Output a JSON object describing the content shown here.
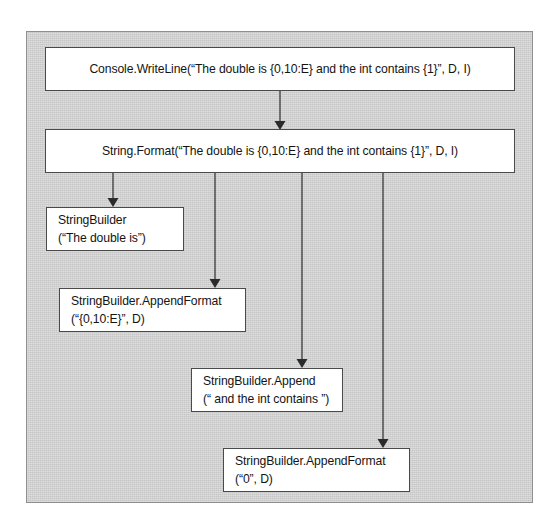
{
  "diagram": {
    "frame": {
      "background_color": "#d2d2d2",
      "border_color": "#8f8f8f"
    },
    "node_style": {
      "fill_color": "#ffffff",
      "border_color": "#4a4a4a",
      "text_color": "#141414"
    },
    "connector_color": "#3a3a3a",
    "nodes": [
      {
        "id": "console-writeline",
        "line1": "Console.WriteLine(“The double is {0,10:E} and the int contains {1}”, D, I)",
        "line2": ""
      },
      {
        "id": "string-format",
        "line1": "String.Format(“The double is {0,10:E} and the int contains {1}”, D, I)",
        "line2": ""
      },
      {
        "id": "stringbuilder",
        "line1": "StringBuilder",
        "line2": "(“The double is”)"
      },
      {
        "id": "stringbuilder-appendformat-1",
        "line1": "StringBuilder.AppendFormat",
        "line2": "(“{0,10:E}”, D)"
      },
      {
        "id": "stringbuilder-append",
        "line1": "StringBuilder.Append",
        "line2": "(“ and the int contains ”)"
      },
      {
        "id": "stringbuilder-appendformat-2",
        "line1": "StringBuilder.AppendFormat",
        "line2": "(“0”, D)"
      }
    ],
    "edges": [
      {
        "id": "edge-console-to-format",
        "from": "console-writeline",
        "to": "string-format"
      },
      {
        "id": "edge-format-to-sb",
        "from": "string-format",
        "to": "stringbuilder"
      },
      {
        "id": "edge-format-to-appendfmt1",
        "from": "string-format",
        "to": "stringbuilder-appendformat-1"
      },
      {
        "id": "edge-format-to-append",
        "from": "string-format",
        "to": "stringbuilder-append"
      },
      {
        "id": "edge-format-to-appendfmt2",
        "from": "string-format",
        "to": "stringbuilder-appendformat-2"
      }
    ]
  }
}
